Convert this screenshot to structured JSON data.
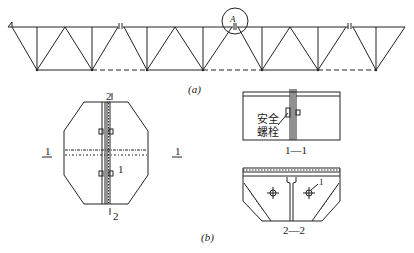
{
  "figure": {
    "part_a": {
      "caption": "(a)",
      "detail_marker": "A",
      "description": "Continuous truss composed of four segments joined at splice points; one joint circled as detail A"
    },
    "part_b": {
      "caption": "(b)",
      "plan_view": {
        "section_mark_left": "1",
        "section_mark_right": "1",
        "section_mark_top": "2",
        "section_mark_bottom": "2",
        "item_callout": "1"
      },
      "section_1_1": {
        "title": "1—1",
        "annotation_line1": "安全",
        "annotation_line2": "螺栓"
      },
      "section_2_2": {
        "title": "2—2",
        "item_callout": "1"
      }
    }
  },
  "colors": {
    "line": "#222222",
    "background": "#ffffff"
  }
}
